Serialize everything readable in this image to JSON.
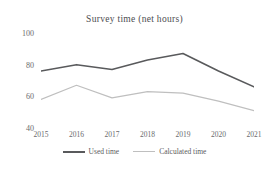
{
  "chart_data": {
    "type": "line",
    "title": "Survey time (net hours)",
    "xlabel": "",
    "ylabel": "",
    "categories": [
      "2015",
      "2016",
      "2017",
      "2018",
      "2019",
      "2020",
      "2021"
    ],
    "ylim": [
      40,
      100
    ],
    "yticks": [
      100,
      80,
      60,
      40
    ],
    "grid": false,
    "legend_position": "bottom",
    "series": [
      {
        "name": "Used time",
        "color": "#595a5c",
        "values": [
          76,
          80,
          77,
          83,
          87,
          76,
          66
        ]
      },
      {
        "name": "Calculated time",
        "color": "#bfbfbf",
        "values": [
          58,
          67,
          59,
          63,
          62,
          57,
          51
        ]
      }
    ]
  }
}
